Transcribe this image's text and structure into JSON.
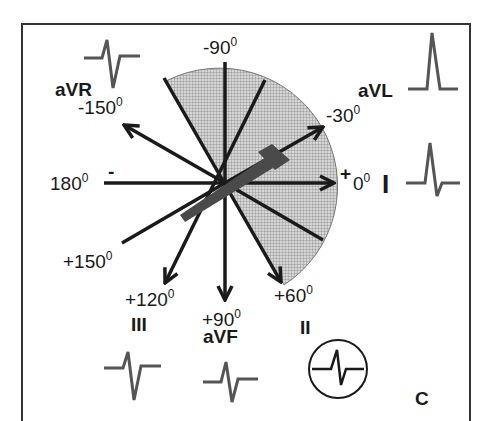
{
  "figure": {
    "panel_label": "C",
    "colors": {
      "line": "#1a1a1a",
      "wave": "#555555",
      "shade": "#c8c8c8",
      "axis_arrow": "#444444",
      "frame": "#333333"
    },
    "axes": [
      {
        "angle": -150,
        "label": "-150",
        "sup": "0",
        "lead": "aVR",
        "arrow": true
      },
      {
        "angle": -90,
        "label": "-90",
        "sup": "0",
        "lead": "",
        "arrow": false
      },
      {
        "angle": -30,
        "label": "-30",
        "sup": "0",
        "lead": "aVL",
        "arrow": true
      },
      {
        "angle": 0,
        "label": "0",
        "sup": "0",
        "lead": "I",
        "arrow": true
      },
      {
        "angle": 60,
        "label": "+60",
        "sup": "0",
        "lead": "II",
        "arrow": true
      },
      {
        "angle": 90,
        "label": "+90",
        "sup": "0",
        "lead": "aVF",
        "arrow": true
      },
      {
        "angle": 120,
        "label": "+120",
        "sup": "0",
        "lead": "III",
        "arrow": true
      },
      {
        "angle": 150,
        "label": "+150",
        "sup": "0",
        "lead": "",
        "arrow": false
      },
      {
        "angle": 180,
        "label": "180",
        "sup": "0",
        "lead": "",
        "arrow": false
      }
    ],
    "polarity": {
      "negative": "-",
      "positive": "+"
    },
    "shaded_sector": {
      "from_deg": -120,
      "to_deg": 60
    },
    "mean_axis_deg": -30,
    "leads": {
      "aVR": {
        "label": "aVR",
        "waveform": "small-r-deep-s"
      },
      "aVL": {
        "label": "aVL",
        "waveform": "tall-r"
      },
      "I": {
        "label": "I",
        "waveform": "r-small-s"
      },
      "II": {
        "label": "II",
        "waveform": "isoelectric-rs",
        "circled": true
      },
      "III": {
        "label": "III",
        "waveform": "small-r-deep-s"
      },
      "aVF": {
        "label": "aVF",
        "waveform": "small-r-deep-s"
      }
    },
    "text": {
      "m150": "-150",
      "m90": "-90",
      "m30": "-30",
      "z0": "0",
      "d180": "180",
      "p150": "+150",
      "p120": "+120",
      "p90": "+90",
      "p60": "+60",
      "deg": "0",
      "minus": "-",
      "plus": "+",
      "aVR": "aVR",
      "aVL": "aVL",
      "I": "I",
      "II": "II",
      "III": "III",
      "aVF": "aVF",
      "C": "C"
    }
  }
}
